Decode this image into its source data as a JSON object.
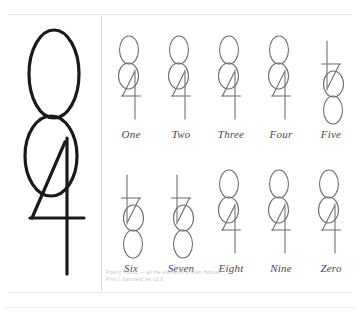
{
  "page": {
    "background_color": "#ffffff",
    "rule_color": "#e9e9e9",
    "divider_color": "#d6d6d6",
    "ink_color": "#1a1a1a",
    "small_ink_color": "#6b6b6b",
    "label_color": "#4a4a4a"
  },
  "hero": {
    "name": "large-composite-numeral",
    "description": "Large hand-drawn composite glyph: two stacked ellipses over a figure-four stroke"
  },
  "grid": {
    "rows": [
      {
        "cells": [
          {
            "label": "One",
            "orientation": "upright"
          },
          {
            "label": "Two",
            "orientation": "upright"
          },
          {
            "label": "Three",
            "orientation": "upright"
          },
          {
            "label": "Four",
            "orientation": "upright"
          },
          {
            "label": "Five",
            "orientation": "inverted"
          }
        ]
      },
      {
        "cells": [
          {
            "label": "Six",
            "orientation": "inverted"
          },
          {
            "label": "Seven",
            "orientation": "inverted"
          },
          {
            "label": "Eight",
            "orientation": "upright"
          },
          {
            "label": "Nine",
            "orientation": "upright"
          },
          {
            "label": "Zero",
            "orientation": "upright"
          }
        ]
      }
    ]
  },
  "attribution": {
    "line1": "Poetry ©2011 — all the elements of Alan Holmes",
    "line2": "Print / Ganzfeld set v2.0"
  }
}
